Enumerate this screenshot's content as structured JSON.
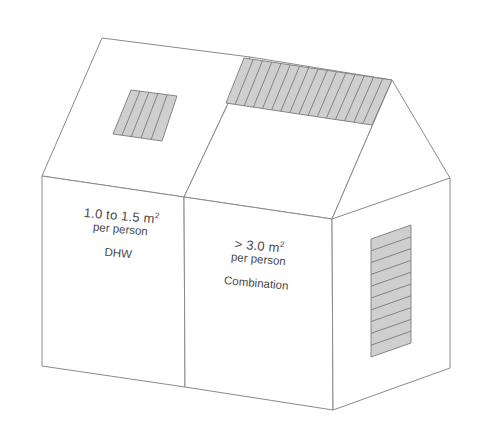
{
  "diagram": {
    "colors": {
      "outline": "#8a8a8a",
      "collector_fill": "#cfcfcf",
      "collector_stroke": "#7a7a7a",
      "text": "#4a4a4a",
      "background": "#ffffff"
    },
    "left_face": {
      "area_value": "1.0 to 1.5 m",
      "area_superscript": "2",
      "per_person": "per person",
      "system_type": "DHW"
    },
    "middle_face": {
      "area_value": "> 3.0 m",
      "area_superscript": "2",
      "per_person": "per person",
      "system_type": "Combination"
    },
    "collectors": [
      {
        "location": "left roof slope",
        "strips": 5,
        "orientation": "vertical"
      },
      {
        "location": "right roof slope near ridge",
        "strips": 16,
        "orientation": "vertical"
      },
      {
        "location": "right side wall",
        "strips": 10,
        "orientation": "horizontal"
      }
    ]
  }
}
